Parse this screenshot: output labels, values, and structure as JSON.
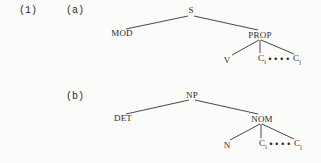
{
  "example_number": "(1)",
  "trees": [
    {
      "label": "(a)",
      "root": "S",
      "left": "MOD",
      "right": "PROP",
      "children": {
        "head": "V",
        "c_first": "C",
        "c_first_sub": "i",
        "ellipsis": "••••",
        "c_last": "C",
        "c_last_sub": "j"
      }
    },
    {
      "label": "(b)",
      "root": "NP",
      "left": "DET",
      "right": "NOM",
      "children": {
        "head": "N",
        "c_first": "C",
        "c_first_sub": "i",
        "ellipsis": "••••",
        "c_last": "C",
        "c_last_sub": "j"
      }
    }
  ]
}
